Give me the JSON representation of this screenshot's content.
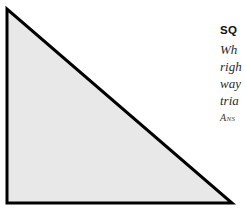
{
  "page": {
    "background_color": "#ffffff",
    "width": 245,
    "height": 209
  },
  "figure": {
    "name": "right-triangle",
    "shape": "right triangle",
    "fill_color": "#e8e8e8",
    "stroke_color": "#000000",
    "stroke_width": 3,
    "vertices": {
      "top_left_apex": [
        7,
        9
      ],
      "bottom_left": [
        7,
        203
      ],
      "bottom_right": [
        232,
        203
      ]
    }
  },
  "text_block": {
    "heading": "SQ",
    "lines": [
      "Wh",
      "righ",
      "way",
      "tria"
    ],
    "answer_line": "Ans"
  }
}
